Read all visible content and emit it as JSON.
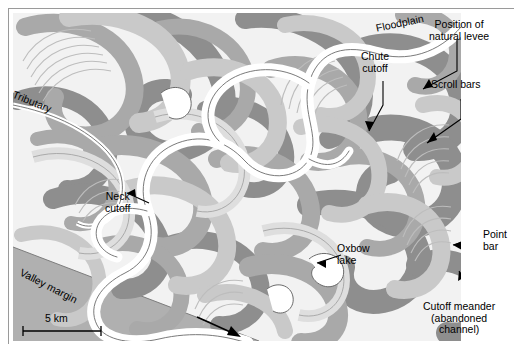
{
  "figure": {
    "background": "#ffffff",
    "border_color": "#9a9a9a"
  },
  "palette": {
    "map_background": "#f2f2f2",
    "band_dark": "#8e8e8e",
    "band_medium": "#a9a9a9",
    "band_light": "#c9c9c9",
    "band_pale": "#dedede",
    "valley_margin": "#b0b0b0",
    "active_channel": "#ffffff",
    "outline": "#6b6b6b",
    "label_text": "#000000"
  },
  "labels": [
    {
      "id": "floodplain",
      "text": "Floodplain",
      "x": 374,
      "y": 14,
      "rotate": -12,
      "leader": false
    },
    {
      "id": "natural-levee",
      "line1": "Position of",
      "line2": "natural levee",
      "x": 428,
      "y": 8,
      "rotate": 0,
      "leader": true
    },
    {
      "id": "scroll-bars",
      "text": "Scroll bars",
      "x": 430,
      "y": 66,
      "rotate": 0,
      "leader": true
    },
    {
      "id": "chute-cutoff",
      "line1": "Chute",
      "line2": "cutoff",
      "x": 359,
      "y": 46,
      "rotate": 0,
      "leader": true
    },
    {
      "id": "tributary",
      "text": "Tributary",
      "x": 12,
      "y": 84,
      "rotate": 22,
      "leader": false
    },
    {
      "id": "neck-cutoff",
      "line1": "Neck",
      "line2": "cutoff",
      "x": 107,
      "y": 188,
      "rotate": 0,
      "leader": true
    },
    {
      "id": "oxbow-lake",
      "line1": "Oxbow",
      "line2": "lake",
      "x": 336,
      "y": 238,
      "rotate": 0,
      "leader": true
    },
    {
      "id": "point-bar",
      "line1": "Point",
      "line2": "bar",
      "x": 482,
      "y": 224,
      "rotate": 0,
      "leader": true
    },
    {
      "id": "cutoff-meander",
      "line1": "Cutoff meander",
      "line2": "(abandoned",
      "line3": "channel)",
      "x": 432,
      "y": 296,
      "rotate": 0,
      "leader": true
    },
    {
      "id": "valley-margin",
      "text": "Valley margin",
      "x": 18,
      "y": 264,
      "rotate": 27,
      "leader": false
    }
  ],
  "scale_bar": {
    "label": "5 km",
    "x": 22,
    "y": 318,
    "length_px": 78
  },
  "flow_arrow": {
    "name": "flow-direction-arrow",
    "x1": 196,
    "y1": 316,
    "x2": 234,
    "y2": 331
  },
  "map_features": {
    "active_channel_name": "active river channel",
    "abandoned_bands": "overlapping former meander loops",
    "scroll_bar_sets": "nested point-bar ridge arcs",
    "valley_margin_name": "valley margin wedge"
  }
}
